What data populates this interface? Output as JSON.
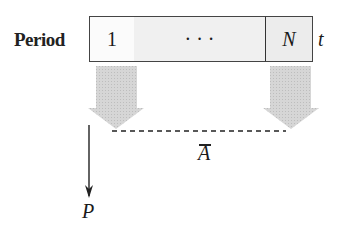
{
  "diagram": {
    "row_label": "Period",
    "cells": [
      {
        "label": "1"
      },
      {
        "label": "· · ·"
      },
      {
        "label": "N"
      }
    ],
    "time_axis_label": "t",
    "cash_flow_label": "Ā",
    "cash_flow_symbol": "A",
    "present_value_label": "P",
    "colors": {
      "arrow_fill": "#d2d2d2",
      "line": "#222222",
      "cell_border": "#444444"
    }
  }
}
